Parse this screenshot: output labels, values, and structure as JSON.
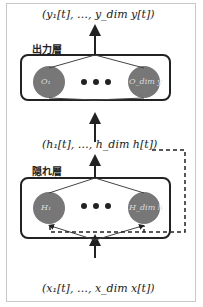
{
  "diagram": {
    "type": "recurrent-neural-network",
    "output_vector": "(y₁[t], …, y_dim y[t])",
    "hidden_vector": "(h₁[t], …, h_dim h[t])",
    "input_vector": "(x₁[t], …, x_dim x[t])",
    "output_layer": {
      "title": "出力層",
      "nodes": [
        "O₁",
        "O_dim y"
      ],
      "ellipsis": "• • •"
    },
    "hidden_layer": {
      "title": "隠れ層",
      "nodes": [
        "H₁",
        "H_dim h"
      ],
      "ellipsis": "• • •"
    },
    "colors": {
      "node_fill": "#777777",
      "line": "#222222",
      "border": "#c8c8c8"
    }
  }
}
